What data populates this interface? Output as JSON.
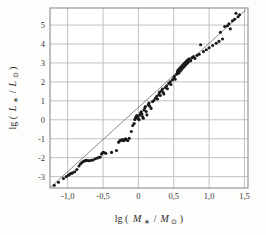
{
  "figure": {
    "background_color": "#fdfdfb",
    "frame_color": "#9a9a9a",
    "grid_color": "#b9b9b9",
    "point_color": "#1a1a1a",
    "line_color": "#5a5a5a"
  },
  "axes": {
    "x_title_prefix": "lg (",
    "x_title_numer": "M",
    "x_title_numer_sub": "∗",
    "x_title_slash": "/",
    "x_title_denom": "M",
    "x_title_denom_sub": "⊙",
    "x_title_suffix": ")",
    "y_title_prefix": "lg (",
    "y_title_numer": "L",
    "y_title_numer_sub": "∗",
    "y_title_slash": "/",
    "y_title_denom": "L",
    "y_title_denom_sub": "⊙",
    "y_title_suffix": ")",
    "x_ticklabels": [
      "-1,0",
      "-0,5",
      "0",
      "0,5",
      "1,0",
      "1,5"
    ],
    "y_ticklabels": [
      "5",
      "4",
      "3",
      "2",
      "1",
      "0",
      "-1",
      "-2",
      "-3"
    ]
  },
  "chart_data": {
    "type": "scatter",
    "title": "",
    "subtitle": "",
    "xlabel": "lg ( M∗ / M⊙ )",
    "ylabel": "lg ( L∗ / L⊙ )",
    "xlim": [
      -1.25,
      1.55
    ],
    "ylim": [
      -3.6,
      5.9
    ],
    "xticks": [
      -1.0,
      -0.5,
      0.0,
      0.5,
      1.0,
      1.5
    ],
    "yticks": [
      5,
      4,
      3,
      2,
      1,
      0,
      -1,
      -2,
      -3
    ],
    "xticklabels": [
      "-1,0",
      "-0,5",
      "0",
      "0,5",
      "1,0",
      "1,5"
    ],
    "yticklabels": [
      "5",
      "4",
      "3",
      "2",
      "1",
      "0",
      "-1",
      "-2",
      "-3"
    ],
    "grid": true,
    "legend": null,
    "series": [
      {
        "name": "stars",
        "marker": "filled-circle",
        "color": "#1a1a1a",
        "points": [
          [
            -1.19,
            -3.46
          ],
          [
            -1.13,
            -3.3
          ],
          [
            -1.06,
            -3.1
          ],
          [
            -1.02,
            -3.0
          ],
          [
            -0.99,
            -2.93
          ],
          [
            -0.97,
            -2.87
          ],
          [
            -0.95,
            -2.83
          ],
          [
            -0.93,
            -2.8
          ],
          [
            -0.9,
            -2.74
          ],
          [
            -0.87,
            -2.62
          ],
          [
            -0.84,
            -2.44
          ],
          [
            -0.82,
            -2.33
          ],
          [
            -0.8,
            -2.26
          ],
          [
            -0.78,
            -2.2
          ],
          [
            -0.76,
            -2.17
          ],
          [
            -0.74,
            -2.14
          ],
          [
            -0.72,
            -2.15
          ],
          [
            -0.7,
            -2.16
          ],
          [
            -0.67,
            -2.14
          ],
          [
            -0.64,
            -2.12
          ],
          [
            -0.61,
            -2.06
          ],
          [
            -0.58,
            -2.02
          ],
          [
            -0.56,
            -1.99
          ],
          [
            -0.54,
            -1.96
          ],
          [
            -0.52,
            -1.8
          ],
          [
            -0.5,
            -1.72
          ],
          [
            -0.48,
            -1.74
          ],
          [
            -0.46,
            -1.77
          ],
          [
            -0.38,
            -1.72
          ],
          [
            -0.31,
            -1.62
          ],
          [
            -0.28,
            -1.18
          ],
          [
            -0.26,
            -1.1
          ],
          [
            -0.24,
            -1.07
          ],
          [
            -0.23,
            -1.05
          ],
          [
            -0.22,
            -1.08
          ],
          [
            -0.21,
            -1.1
          ],
          [
            -0.2,
            -1.04
          ],
          [
            -0.18,
            -1.0
          ],
          [
            -0.17,
            -1.07
          ],
          [
            -0.15,
            -1.09
          ],
          [
            -0.13,
            -0.98
          ],
          [
            -0.1,
            -0.62
          ],
          [
            -0.08,
            -0.3
          ],
          [
            -0.06,
            -0.2
          ],
          [
            -0.05,
            0.02
          ],
          [
            -0.04,
            0.1
          ],
          [
            -0.03,
            0.18
          ],
          [
            -0.02,
            0.22
          ],
          [
            -0.01,
            0.14
          ],
          [
            0.0,
            0.05
          ],
          [
            0.01,
            0.0
          ],
          [
            0.02,
            0.24
          ],
          [
            0.03,
            0.34
          ],
          [
            0.04,
            0.42
          ],
          [
            0.05,
            0.3
          ],
          [
            0.06,
            0.16
          ],
          [
            0.07,
            0.08
          ],
          [
            0.08,
            0.52
          ],
          [
            0.09,
            0.62
          ],
          [
            0.1,
            0.7
          ],
          [
            0.11,
            0.44
          ],
          [
            0.12,
            0.26
          ],
          [
            0.14,
            0.8
          ],
          [
            0.15,
            0.88
          ],
          [
            0.16,
            0.72
          ],
          [
            0.18,
            0.6
          ],
          [
            0.2,
            0.96
          ],
          [
            0.22,
            1.02
          ],
          [
            0.24,
            1.14
          ],
          [
            0.26,
            1.24
          ],
          [
            0.27,
            1.1
          ],
          [
            0.29,
            1.34
          ],
          [
            0.3,
            1.46
          ],
          [
            0.31,
            1.28
          ],
          [
            0.33,
            1.54
          ],
          [
            0.34,
            1.62
          ],
          [
            0.35,
            1.44
          ],
          [
            0.36,
            1.36
          ],
          [
            0.38,
            1.7
          ],
          [
            0.4,
            1.8
          ],
          [
            0.41,
            1.64
          ],
          [
            0.43,
            1.92
          ],
          [
            0.45,
            2.0
          ],
          [
            0.46,
            1.86
          ],
          [
            0.48,
            2.1
          ],
          [
            0.5,
            2.2
          ],
          [
            0.51,
            2.3
          ],
          [
            0.52,
            2.14
          ],
          [
            0.54,
            2.4
          ],
          [
            0.55,
            2.52
          ],
          [
            0.56,
            2.62
          ],
          [
            0.57,
            2.46
          ],
          [
            0.58,
            2.7
          ],
          [
            0.59,
            2.56
          ],
          [
            0.6,
            2.78
          ],
          [
            0.61,
            2.66
          ],
          [
            0.62,
            2.86
          ],
          [
            0.63,
            2.74
          ],
          [
            0.64,
            2.94
          ],
          [
            0.65,
            2.82
          ],
          [
            0.66,
            3.02
          ],
          [
            0.67,
            2.9
          ],
          [
            0.68,
            3.1
          ],
          [
            0.69,
            2.98
          ],
          [
            0.7,
            3.16
          ],
          [
            0.71,
            3.06
          ],
          [
            0.72,
            3.22
          ],
          [
            0.74,
            3.12
          ],
          [
            0.76,
            3.28
          ],
          [
            0.78,
            3.34
          ],
          [
            0.8,
            3.24
          ],
          [
            0.83,
            3.4
          ],
          [
            0.86,
            3.46
          ],
          [
            0.88,
            3.96
          ],
          [
            0.92,
            3.6
          ],
          [
            0.96,
            3.7
          ],
          [
            1.0,
            3.8
          ],
          [
            1.05,
            3.92
          ],
          [
            1.1,
            4.04
          ],
          [
            1.14,
            4.14
          ],
          [
            1.16,
            4.62
          ],
          [
            1.19,
            4.26
          ],
          [
            1.22,
            4.92
          ],
          [
            1.26,
            4.96
          ],
          [
            1.28,
            5.06
          ],
          [
            1.3,
            4.8
          ],
          [
            1.33,
            5.22
          ],
          [
            1.36,
            5.3
          ],
          [
            1.38,
            5.62
          ],
          [
            1.41,
            5.44
          ],
          [
            1.43,
            5.54
          ]
        ]
      }
    ],
    "fit_line": {
      "name": "mass-luminosity relation",
      "x": [
        -1.24,
        1.52
      ],
      "y": [
        -3.55,
        5.8
      ],
      "style": "thin-solid"
    }
  }
}
